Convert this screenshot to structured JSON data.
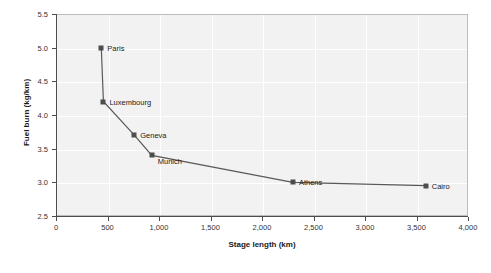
{
  "chart_data": {
    "type": "line",
    "title": "",
    "xlabel": "Stage length (km)",
    "ylabel": "Fuel burn (kg/km)",
    "xlim": [
      0,
      4000
    ],
    "ylim": [
      2.5,
      5.5
    ],
    "grid": true,
    "legend": "none",
    "x_ticks": [
      "0",
      "500",
      "1,000",
      "1,500",
      "2,000",
      "2,500",
      "3,000",
      "3,500",
      "4,000"
    ],
    "x_tick_values": [
      0,
      500,
      1000,
      1500,
      2000,
      2500,
      3000,
      3500,
      4000
    ],
    "y_ticks": [
      "2.5",
      "3.0",
      "3.5",
      "4.0",
      "4.5",
      "5.0",
      "5.5"
    ],
    "y_tick_values": [
      2.5,
      3.0,
      3.5,
      4.0,
      4.5,
      5.0,
      5.5
    ],
    "points": [
      {
        "label": "Paris",
        "x": 440,
        "y": 5.0
      },
      {
        "label": "Luxembourg",
        "x": 460,
        "y": 4.2
      },
      {
        "label": "Geneva",
        "x": 760,
        "y": 3.7
      },
      {
        "label": "Munich",
        "x": 930,
        "y": 3.4
      },
      {
        "label": "Athens",
        "x": 2300,
        "y": 3.0
      },
      {
        "label": "Cairo",
        "x": 3590,
        "y": 2.95
      }
    ],
    "colors": {
      "panel_background": "#f2f2f2",
      "panel_border": "#bdbdbd",
      "gridline": "#ffffff",
      "axis": "#4d4d4d",
      "marker": "#4d4d4d",
      "line": "#595959",
      "text": "#1a1a1a",
      "page_background": "#ffffff"
    }
  }
}
